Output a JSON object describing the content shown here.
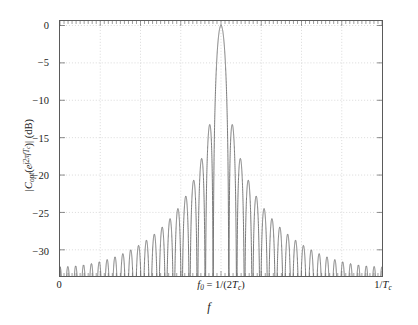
{
  "chart_data": {
    "type": "line",
    "title": "",
    "xlabel": "f",
    "ylabel": "|C_opt(e^{j2πfT_c})| (dB)",
    "xlim": [
      0,
      1
    ],
    "ylim": [
      -33.5,
      0.6
    ],
    "grid": true,
    "legend": null,
    "x_tick_labels": [
      "0",
      "f0 = 1/(2Tc)",
      "1/Tc"
    ],
    "x_tick_positions": [
      0,
      0.5,
      1
    ],
    "y_tick_labels": [
      "0",
      "−5",
      "−10",
      "−15",
      "−20",
      "−25",
      "−30"
    ],
    "y_tick_values": [
      0,
      -5,
      -10,
      -15,
      -20,
      -25,
      -30
    ],
    "series": [
      {
        "name": "|C_opt|",
        "description": "Magnitude response of the optimum chip shaping filter, sinc-like main lobe centred at f0 = 1/(2Tc) with decaying sidelobes.",
        "n_lobes": 41,
        "main_lobe_center": 0.5,
        "main_lobe_peak_db": 0,
        "sidelobe_peaks_db": [
          -13.3,
          -17.8,
          -20.8,
          -23.0,
          -24.6,
          -26.0,
          -27.2,
          -28.2,
          -29.0,
          -29.8,
          -30.4,
          -31.0,
          -31.5,
          -32.0,
          -32.4,
          -32.8,
          -33.1,
          -33.4,
          -33.6,
          -33.8
        ],
        "line_color": "#6b6b6b",
        "line_width": 0.9
      }
    ]
  },
  "axis": {
    "box_color": "#5a5a5a",
    "grid_color": "#c9c9c9",
    "background": "#ffffff",
    "y_ticks": [
      {
        "label": "0",
        "value": 0
      },
      {
        "label": "−5",
        "value": -5
      },
      {
        "label": "−10",
        "value": -10
      },
      {
        "label": "−15",
        "value": -15
      },
      {
        "label": "−20",
        "value": -20
      },
      {
        "label": "−25",
        "value": -25
      },
      {
        "label": "−30",
        "value": -30
      }
    ],
    "x_ticks": [
      {
        "label": "0",
        "value": 0
      },
      {
        "label": "f0 = 1/(2Tc)",
        "value": 0.5
      },
      {
        "label": "1/Tc",
        "value": 1
      }
    ]
  },
  "labels": {
    "x_axis_title": "f",
    "y_axis_title": "|C_opt(e^{j2πfT_c})| (dB)",
    "x_left": "0",
    "x_mid_prefix": "f",
    "x_mid_sub": "0",
    "x_mid_eq": " = 1/(2",
    "x_mid_T": "T",
    "x_mid_Tsub": "c",
    "x_mid_close": ")",
    "x_right_num": "1/",
    "x_right_T": "T",
    "x_right_sub": "c"
  }
}
